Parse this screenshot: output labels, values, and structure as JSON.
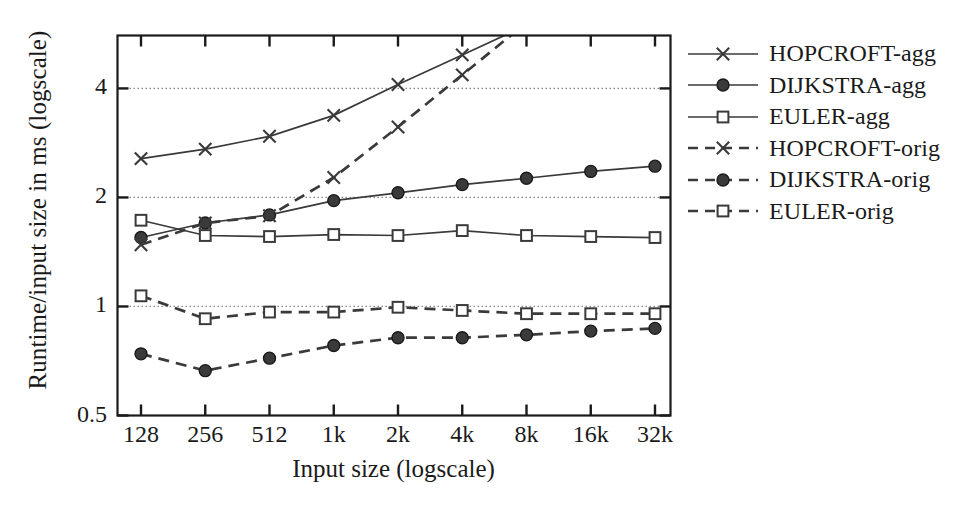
{
  "chart_data": {
    "type": "line",
    "title": "",
    "xlabel": "Input size (logscale)",
    "ylabel": "Runtime/input size in ms (logscale)",
    "x_scale": "log2",
    "y_scale": "log2",
    "categories": [
      "128",
      "256",
      "512",
      "1k",
      "2k",
      "4k",
      "8k",
      "16k",
      "32k"
    ],
    "x_tick_labels": [
      "128",
      "256",
      "512",
      "1k",
      "2k",
      "4k",
      "8k",
      "16k",
      "32k"
    ],
    "y_tick_labels": [
      "0.5",
      "1",
      "2",
      "4"
    ],
    "y_tick_values": [
      0.5,
      1,
      2,
      4
    ],
    "ylim": [
      0.5,
      5.6
    ],
    "grid": "horizontal-dotted",
    "legend_position": "right-outside",
    "series": [
      {
        "name": "HOPCROFT-agg",
        "marker": "cross",
        "dash": "solid",
        "values": [
          2.56,
          2.72,
          2.95,
          3.37,
          4.1,
          4.95,
          null,
          null,
          null
        ],
        "clipped_above": true
      },
      {
        "name": "DIJKSTRA-agg",
        "marker": "disc",
        "dash": "solid",
        "values": [
          1.55,
          1.7,
          1.79,
          1.96,
          2.06,
          2.17,
          2.26,
          2.36,
          2.44
        ]
      },
      {
        "name": "EULER-agg",
        "marker": "square",
        "dash": "solid",
        "values": [
          1.73,
          1.57,
          1.56,
          1.58,
          1.57,
          1.62,
          1.57,
          1.56,
          1.55
        ]
      },
      {
        "name": "HOPCROFT-orig",
        "marker": "cross",
        "dash": "dashed",
        "values": [
          1.48,
          1.7,
          1.78,
          2.27,
          3.13,
          4.36,
          null,
          null,
          null
        ],
        "clipped_above": true
      },
      {
        "name": "DIJKSTRA-orig",
        "marker": "disc",
        "dash": "dashed",
        "values": [
          0.74,
          0.665,
          0.72,
          0.78,
          0.82,
          0.82,
          0.835,
          0.855,
          0.87
        ]
      },
      {
        "name": "EULER-orig",
        "marker": "square",
        "dash": "dashed",
        "values": [
          1.07,
          0.925,
          0.965,
          0.965,
          0.995,
          0.975,
          0.955,
          0.955,
          0.955
        ]
      }
    ]
  },
  "legend": {
    "entries": [
      "HOPCROFT-agg",
      "DIJKSTRA-agg",
      "EULER-agg",
      "HOPCROFT-orig",
      "DIJKSTRA-orig",
      "EULER-orig"
    ]
  },
  "colors": {
    "line": "#3a3a3a",
    "axis": "#1a1a1a",
    "grid": "#808080",
    "text": "#1a1a1a",
    "background": "#ffffff"
  }
}
